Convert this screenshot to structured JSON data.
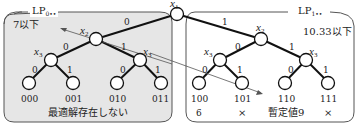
{
  "boxes": {
    "left": {
      "title": "LP",
      "sub": "0••",
      "bound": "7以下",
      "footer": "最適解存在しない",
      "fill": "#e6e6e6"
    },
    "right": {
      "title": "LP",
      "sub": "1••",
      "bound": "10.33以下",
      "fill": "#ffffff"
    }
  },
  "nodes": {
    "root": "x1",
    "left_x2": "x2",
    "right_x2": "x2",
    "x3": "x3"
  },
  "edges": {
    "zero": "0",
    "one": "1"
  },
  "leaves": {
    "left": [
      "000",
      "001",
      "010",
      "011"
    ],
    "right": [
      "100",
      "101",
      "110",
      "111"
    ]
  },
  "results": {
    "r100": "6",
    "r101": "×",
    "r110": "暫定値9",
    "r111": "×"
  }
}
